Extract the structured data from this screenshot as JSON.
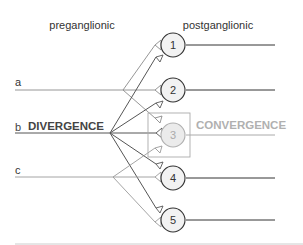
{
  "headers": {
    "preganglionic": "preganglionic",
    "postganglionic": "postganglionic"
  },
  "inputs": [
    {
      "id": "a",
      "label": "a"
    },
    {
      "id": "b",
      "label": "b"
    },
    {
      "id": "c",
      "label": "c"
    }
  ],
  "annotations": {
    "divergence": "DIVERGENCE",
    "convergence": "CONVERGENCE"
  },
  "neurons": [
    {
      "label": "1",
      "highlighted": false
    },
    {
      "label": "2",
      "highlighted": false
    },
    {
      "label": "3",
      "highlighted": true
    },
    {
      "label": "4",
      "highlighted": false
    },
    {
      "label": "5",
      "highlighted": false
    }
  ],
  "colors": {
    "dark_line": "#555555",
    "light_line": "#9a9a9a",
    "convergence_text": "#b0b0b0",
    "divergence_text": "#444444",
    "neuron3_fill": "#ebebeb",
    "neuron_fill": "#f2f2f2"
  }
}
